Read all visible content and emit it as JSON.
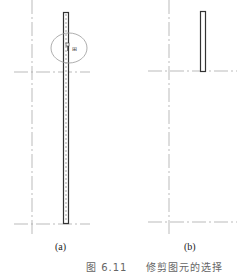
{
  "figure": {
    "number": "图 6.11",
    "title": "修剪图元的选择",
    "panels": [
      {
        "label": "(a)",
        "description": "long vertical element with selection circle and cursor"
      },
      {
        "label": "(b)",
        "description": "trimmed short vertical element"
      }
    ],
    "cursor_glyph": "⁂"
  },
  "colors": {
    "line": "#333333",
    "axis": "#999999",
    "circle": "#888888",
    "background": "#ffffff"
  }
}
